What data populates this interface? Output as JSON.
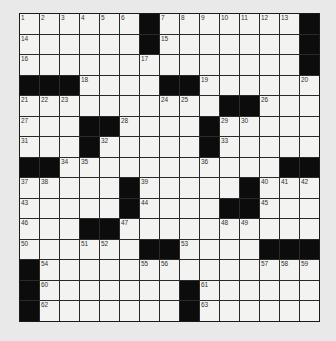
{
  "puzzle": {
    "rows": 15,
    "cols": 15,
    "grid": [
      [
        "1",
        "2",
        "3",
        "4",
        "5",
        "6",
        "#",
        "7",
        "8",
        "9",
        "10",
        "11",
        "12",
        "13",
        "#"
      ],
      [
        "14",
        "",
        "",
        "",
        "",
        "",
        "#",
        "15",
        "",
        "",
        "",
        "",
        "",
        "",
        "#"
      ],
      [
        "16",
        "",
        "",
        "",
        "",
        "",
        "17",
        "",
        "",
        "",
        "",
        "",
        "",
        "",
        "#"
      ],
      [
        "#",
        "#",
        "#",
        "18",
        "",
        "",
        "",
        "#",
        "#",
        "19",
        "",
        "",
        "",
        "",
        "20"
      ],
      [
        "21",
        "22",
        "23",
        "",
        "",
        "",
        "",
        "24",
        "25",
        "",
        "#",
        "#",
        "26",
        "",
        ""
      ],
      [
        "27",
        "",
        "",
        "#",
        "#",
        "28",
        "",
        "",
        "",
        "#",
        "29",
        "30",
        "",
        "",
        ""
      ],
      [
        "31",
        "",
        "",
        "#",
        "32",
        "",
        "",
        "",
        "",
        "#",
        "33",
        "",
        "",
        "",
        ""
      ],
      [
        "#",
        "#",
        "34",
        "35",
        "",
        "",
        "",
        "",
        "",
        "36",
        "",
        "",
        "",
        "#",
        "#"
      ],
      [
        "37",
        "38",
        "",
        "",
        "",
        "#",
        "39",
        "",
        "",
        "",
        "",
        "#",
        "40",
        "41",
        "42"
      ],
      [
        "43",
        "",
        "",
        "",
        "",
        "#",
        "44",
        "",
        "",
        "",
        "#",
        "#",
        "45",
        "",
        ""
      ],
      [
        "46",
        "",
        "",
        "#",
        "#",
        "47",
        "",
        "",
        "",
        "",
        "48",
        "49",
        "",
        "",
        ""
      ],
      [
        "50",
        "",
        "",
        "51",
        "52",
        "",
        "#",
        "#",
        "53",
        "",
        "",
        "",
        "#",
        "#",
        "#"
      ],
      [
        "#",
        "54",
        "",
        "",
        "",
        "",
        "55",
        "56",
        "",
        "",
        "",
        "",
        "57",
        "58",
        "59"
      ],
      [
        "#",
        "60",
        "",
        "",
        "",
        "",
        "",
        "",
        "#",
        "61",
        "",
        "",
        "",
        "",
        ""
      ],
      [
        "#",
        "62",
        "",
        "",
        "",
        "",
        "",
        "",
        "#",
        "63",
        "",
        "",
        "",
        "",
        ""
      ]
    ]
  }
}
